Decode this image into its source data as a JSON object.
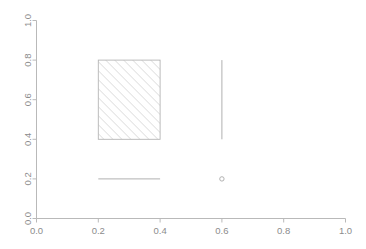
{
  "chart_data": {
    "type": "scatter",
    "title": "",
    "subtitle": "",
    "xlabel": "",
    "ylabel": "",
    "xlim": [
      0.0,
      1.0
    ],
    "ylim": [
      0.0,
      1.0
    ],
    "grid": false,
    "legend": false,
    "x_ticks": [
      "0.0",
      "0.2",
      "0.4",
      "0.6",
      "0.8",
      "1.0"
    ],
    "x_tick_values": [
      0.0,
      0.2,
      0.4,
      0.6,
      0.8,
      1.0
    ],
    "y_ticks": [
      "0.0",
      "0.2",
      "0.4",
      "0.6",
      "0.8",
      "1.0"
    ],
    "y_tick_values": [
      0.0,
      0.2,
      0.4,
      0.6,
      0.8,
      1.0
    ],
    "y_tick_label_rotation": -90,
    "annotations": [
      {
        "name": "hatched-rectangle",
        "shape": "rect",
        "x0": 0.2,
        "y0": 0.4,
        "x1": 0.4,
        "y1": 0.8,
        "fill": "hatch-45",
        "hatch_angle_deg": 45,
        "hatch_spacing_px": 4.5,
        "color": "#b5b5b5",
        "border": true
      },
      {
        "name": "horizontal-segment",
        "shape": "segment",
        "x0": 0.2,
        "y0": 0.2,
        "x1": 0.4,
        "y1": 0.2,
        "color": "#b0b0b0",
        "linewidth": 1
      },
      {
        "name": "vertical-segment",
        "shape": "segment",
        "x0": 0.6,
        "y0": 0.4,
        "x1": 0.6,
        "y1": 0.8,
        "color": "#b0b0b0",
        "linewidth": 1
      },
      {
        "name": "open-point",
        "shape": "point",
        "x": 0.6,
        "y": 0.2,
        "marker": "open-circle",
        "radius_px": 2.2,
        "color": "#a8a8a8"
      }
    ],
    "points": [
      {
        "x": 0.6,
        "y": 0.2
      }
    ],
    "colors": {
      "axis": "#b9b9b9",
      "tick_label": "#8c8c8c",
      "shape_stroke": "#b5b5b5",
      "hatch": "#c2c2c2",
      "background": "#ffffff"
    }
  },
  "axes": {
    "x_axis_name": "x-axis",
    "y_axis_name": "y-axis"
  }
}
